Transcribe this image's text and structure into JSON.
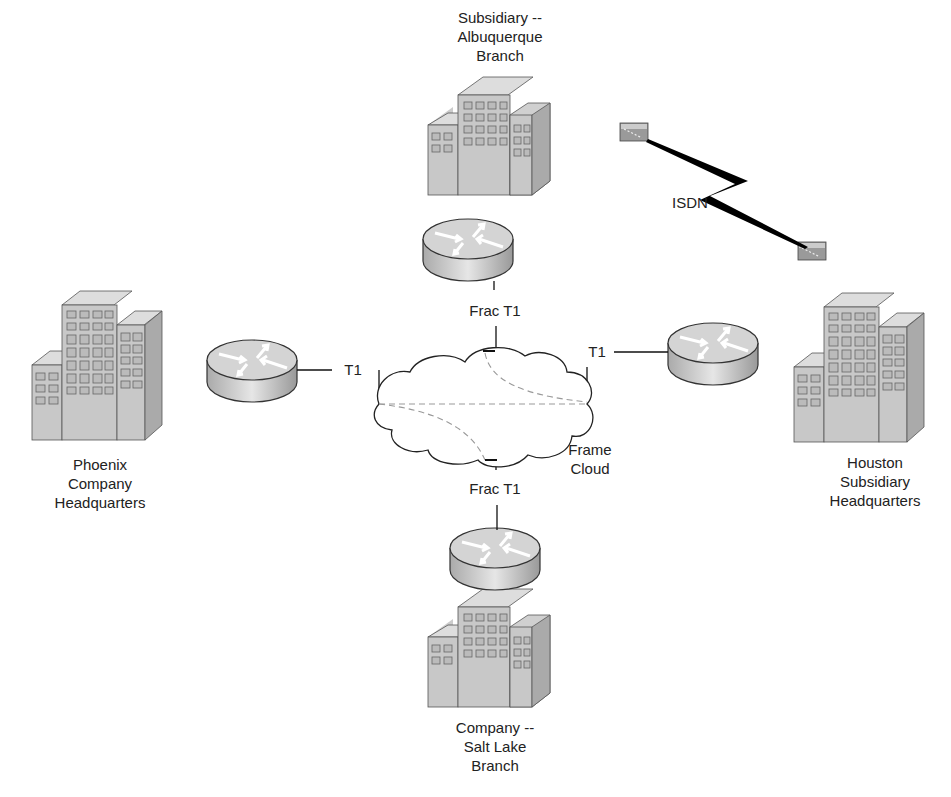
{
  "sites": {
    "albuquerque": {
      "label": "Subsidiary --\nAlbuquerque\nBranch"
    },
    "phoenix": {
      "label": "Phoenix\nCompany\nHeadquarters"
    },
    "houston": {
      "label": "Houston\nSubsidiary\nHeadquarters"
    },
    "saltlake": {
      "label": "Company --\nSalt Lake\nBranch"
    }
  },
  "links": {
    "top": "Frac T1",
    "bottom": "Frac T1",
    "left": "T1",
    "right": "T1",
    "isdn": "ISDN"
  },
  "cloud": {
    "label": "Frame\nCloud"
  },
  "colors": {
    "building": "#c8c8c8",
    "building_dark": "#a8a8a8",
    "router": "#cfcfcf",
    "line": "#111111",
    "dash": "#999999"
  }
}
